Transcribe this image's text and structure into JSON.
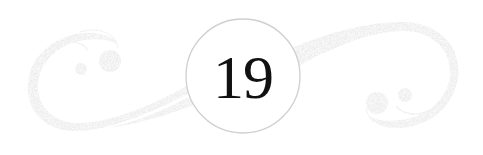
{
  "ornament": {
    "chapter_number": "19",
    "icons": {
      "left": "swirl-flourish-icon",
      "right": "swirl-flourish-icon",
      "medallion": "circle-medallion-icon"
    },
    "colors": {
      "background": "#ffffff",
      "flourish": "#c8c8c8",
      "flourish_dark": "#b9b9b9",
      "medallion_fill": "#ffffff",
      "medallion_stroke": "#cfcfcf",
      "number": "#111111"
    }
  }
}
